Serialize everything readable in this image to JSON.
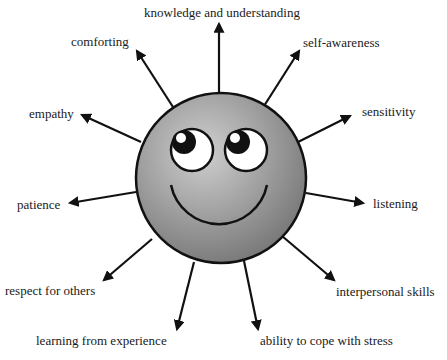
{
  "diagram": {
    "center_label": "smiley-face",
    "colors": {
      "face_fill_light": "#c8c8c8",
      "face_fill_dark": "#7a7a7a",
      "stroke": "#111111",
      "text": "#1a1a1a",
      "background": "#ffffff"
    },
    "qualities": [
      {
        "id": "knowledge",
        "label": "knowledge and understanding"
      },
      {
        "id": "self-awareness",
        "label": "self-awareness"
      },
      {
        "id": "sensitivity",
        "label": "sensitivity"
      },
      {
        "id": "listening",
        "label": "listening"
      },
      {
        "id": "interpersonal",
        "label": "interpersonal skills"
      },
      {
        "id": "cope-stress",
        "label": "ability to cope with stress"
      },
      {
        "id": "learning",
        "label": "learning from experience"
      },
      {
        "id": "respect",
        "label": "respect for others"
      },
      {
        "id": "patience",
        "label": "patience"
      },
      {
        "id": "empathy",
        "label": "empathy"
      },
      {
        "id": "comforting",
        "label": "comforting"
      }
    ]
  }
}
